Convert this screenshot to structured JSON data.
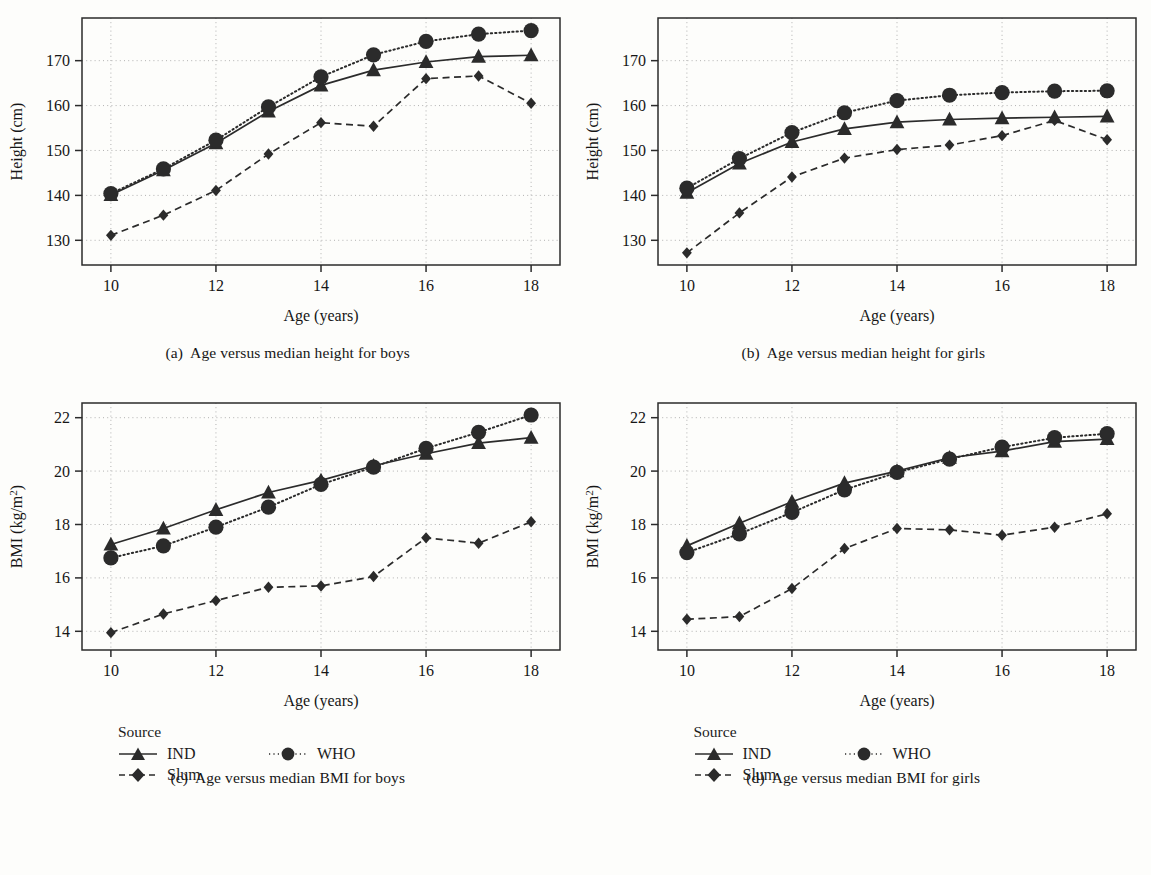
{
  "figure": {
    "legend": {
      "title": "Source",
      "entries": [
        {
          "key": "IND",
          "label": "IND",
          "marker": "triangle-marker",
          "line": "solid"
        },
        {
          "key": "WHO",
          "label": "WHO",
          "marker": "circle-marker",
          "line": "dotted"
        },
        {
          "key": "Slum",
          "label": "Slum",
          "marker": "diamond-marker",
          "line": "dashed"
        }
      ]
    },
    "captions": [
      {
        "id": "a",
        "label": "(a)",
        "text": "Age versus median height for boys"
      },
      {
        "id": "b",
        "label": "(b)",
        "text": "Age versus median height for girls"
      },
      {
        "id": "c",
        "label": "(c)",
        "text": "Age versus median BMI for boys"
      },
      {
        "id": "d",
        "label": "(d)",
        "text": "Age versus median BMI for girls"
      }
    ],
    "ink_color": "#2b2b2b",
    "grid_color": "#a9a9a9"
  },
  "chart_data": [
    {
      "panel": "a",
      "type": "line",
      "title": "Age versus median height for boys",
      "xlabel": "Age (years)",
      "ylabel": "Height (cm)",
      "x": [
        10,
        11,
        12,
        13,
        14,
        15,
        16,
        17,
        18
      ],
      "xlim": [
        9.45,
        18.55
      ],
      "ylim": [
        124.5,
        179.5
      ],
      "xticks": [
        10,
        12,
        14,
        16,
        18
      ],
      "yticks": [
        130,
        140,
        150,
        160,
        170
      ],
      "grid": true,
      "legend_position": "below-figure",
      "series": [
        {
          "name": "IND",
          "marker": "triangle",
          "line": "solid",
          "values": [
            140.1,
            145.6,
            151.6,
            158.7,
            164.5,
            167.9,
            169.7,
            170.9,
            171.2
          ]
        },
        {
          "name": "WHO",
          "marker": "circle",
          "line": "dotted",
          "values": [
            140.4,
            145.9,
            152.3,
            159.7,
            166.4,
            171.3,
            174.3,
            175.9,
            176.7
          ]
        },
        {
          "name": "Slum",
          "marker": "diamond",
          "line": "dashed",
          "values": [
            131.1,
            135.6,
            141.1,
            149.2,
            156.2,
            155.4,
            166.0,
            166.6,
            160.5
          ]
        }
      ]
    },
    {
      "panel": "b",
      "type": "line",
      "title": "Age versus median height for girls",
      "xlabel": "Age (years)",
      "ylabel": "Height (cm)",
      "x": [
        10,
        11,
        12,
        13,
        14,
        15,
        16,
        17,
        18
      ],
      "xlim": [
        9.45,
        18.55
      ],
      "ylim": [
        124.5,
        179.5
      ],
      "xticks": [
        10,
        12,
        14,
        16,
        18
      ],
      "yticks": [
        130,
        140,
        150,
        160,
        170
      ],
      "grid": true,
      "legend_position": "below-figure",
      "series": [
        {
          "name": "IND",
          "marker": "triangle",
          "line": "solid",
          "values": [
            140.6,
            147.1,
            151.9,
            154.8,
            156.3,
            156.9,
            157.2,
            157.4,
            157.6
          ]
        },
        {
          "name": "WHO",
          "marker": "circle",
          "line": "dotted",
          "values": [
            141.6,
            148.2,
            154.0,
            158.4,
            161.1,
            162.3,
            162.9,
            163.2,
            163.3
          ]
        },
        {
          "name": "Slum",
          "marker": "diamond",
          "line": "dashed",
          "values": [
            127.2,
            136.1,
            144.1,
            148.3,
            150.2,
            151.2,
            153.3,
            156.7,
            152.4
          ]
        }
      ]
    },
    {
      "panel": "c",
      "type": "line",
      "title": "Age versus median BMI for boys",
      "xlabel": "Age (years)",
      "ylabel": "BMI (kg/m2)",
      "ylabel_display": "BMI (kg/m²)",
      "x": [
        10,
        11,
        12,
        13,
        14,
        15,
        16,
        17,
        18
      ],
      "xlim": [
        9.45,
        18.55
      ],
      "ylim": [
        13.3,
        22.55
      ],
      "xticks": [
        10,
        12,
        14,
        16,
        18
      ],
      "yticks": [
        14,
        16,
        18,
        20,
        22
      ],
      "grid": true,
      "legend_position": "below-figure",
      "series": [
        {
          "name": "IND",
          "marker": "triangle",
          "line": "solid",
          "values": [
            17.25,
            17.85,
            18.55,
            19.2,
            19.65,
            20.2,
            20.65,
            21.05,
            21.25
          ]
        },
        {
          "name": "WHO",
          "marker": "circle",
          "line": "dotted",
          "values": [
            16.75,
            17.2,
            17.9,
            18.65,
            19.5,
            20.15,
            20.85,
            21.45,
            22.1
          ]
        },
        {
          "name": "Slum",
          "marker": "diamond",
          "line": "dashed",
          "values": [
            13.95,
            14.65,
            15.15,
            15.65,
            15.7,
            16.05,
            17.5,
            17.3,
            18.1
          ]
        }
      ]
    },
    {
      "panel": "d",
      "type": "line",
      "title": "Age versus median BMI for girls",
      "xlabel": "Age (years)",
      "ylabel": "BMI (kg/m2)",
      "ylabel_display": "BMI (kg/m²)",
      "x": [
        10,
        11,
        12,
        13,
        14,
        15,
        16,
        17,
        18
      ],
      "xlim": [
        9.45,
        18.55
      ],
      "ylim": [
        13.3,
        22.55
      ],
      "xticks": [
        10,
        12,
        14,
        16,
        18
      ],
      "yticks": [
        14,
        16,
        18,
        20,
        22
      ],
      "grid": true,
      "legend_position": "below-figure",
      "series": [
        {
          "name": "IND",
          "marker": "triangle",
          "line": "solid",
          "values": [
            17.2,
            18.05,
            18.85,
            19.55,
            20.0,
            20.5,
            20.75,
            21.1,
            21.2
          ]
        },
        {
          "name": "WHO",
          "marker": "circle",
          "line": "dotted",
          "values": [
            16.95,
            17.65,
            18.45,
            19.3,
            19.95,
            20.45,
            20.9,
            21.25,
            21.4
          ]
        },
        {
          "name": "Slum",
          "marker": "diamond",
          "line": "dashed",
          "values": [
            14.45,
            14.55,
            15.6,
            17.1,
            17.85,
            17.8,
            17.6,
            17.9,
            18.4
          ]
        }
      ]
    }
  ]
}
